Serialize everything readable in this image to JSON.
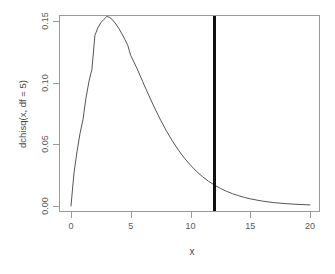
{
  "chart_data": {
    "type": "line",
    "title": "",
    "subtitle": "",
    "xlabel": "x",
    "ylabel": "dchisq(x, df = 5)",
    "xlim": [
      0,
      20
    ],
    "ylim": [
      0.0,
      0.155
    ],
    "grid": false,
    "legend": null,
    "legend_position": "none",
    "xticks": [
      0,
      5,
      10,
      15,
      20
    ],
    "xticklabels": [
      "0",
      "5",
      "10",
      "15",
      "20"
    ],
    "yticks": [
      0.0,
      0.05,
      0.1,
      0.15
    ],
    "yticklabels": [
      "0.00",
      "0.05",
      "0.10",
      "0.15"
    ],
    "series": [
      {
        "name": "dchisq(x, df = 5)",
        "type": "line",
        "color": "#555555",
        "width": 1,
        "x": [
          0.0,
          0.25,
          0.5,
          0.75,
          1.0,
          1.25,
          1.5,
          1.75,
          2.0,
          2.25,
          2.5,
          2.75,
          3.0,
          3.25,
          3.5,
          3.75,
          4.0,
          4.25,
          4.5,
          4.75,
          5.0,
          5.5,
          6.0,
          6.5,
          7.0,
          7.5,
          8.0,
          8.5,
          9.0,
          9.5,
          10.0,
          10.5,
          11.0,
          11.5,
          12.0,
          12.5,
          13.0,
          13.5,
          14.0,
          14.5,
          15.0,
          16.0,
          17.0,
          18.0,
          19.0,
          20.0
        ],
        "y": [
          0.0,
          0.0268,
          0.0439,
          0.0586,
          0.0699,
          0.0875,
          0.1008,
          0.1108,
          0.1383,
          0.1445,
          0.1487,
          0.1513,
          0.1537,
          0.1528,
          0.1507,
          0.1476,
          0.144,
          0.1398,
          0.1352,
          0.1303,
          0.122,
          0.112,
          0.1009,
          0.0899,
          0.0794,
          0.0696,
          0.0606,
          0.0525,
          0.0452,
          0.0387,
          0.0331,
          0.0281,
          0.0238,
          0.0201,
          0.017,
          0.0143,
          0.012,
          0.01,
          0.0084,
          0.007,
          0.0058,
          0.004,
          0.0027,
          0.0019,
          0.0013,
          0.0009
        ]
      }
    ],
    "annotations": [
      {
        "name": "vertical-reference-line",
        "type": "vline",
        "x": 12,
        "color": "#101010",
        "width": 3,
        "label": ""
      }
    ]
  }
}
